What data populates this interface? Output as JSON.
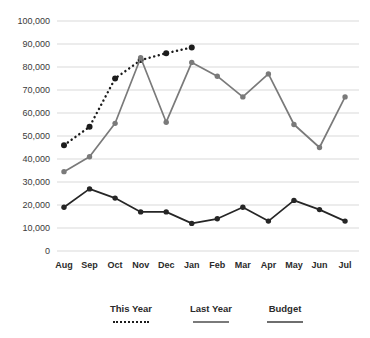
{
  "chart_data": {
    "type": "line",
    "title": "",
    "xlabel": "",
    "ylabel": "",
    "categories": [
      "Aug",
      "Sep",
      "Oct",
      "Nov",
      "Dec",
      "Jan",
      "Feb",
      "Mar",
      "Apr",
      "May",
      "Jun",
      "Jul"
    ],
    "ylim": [
      0,
      100000
    ],
    "ytick_labels": [
      "100,000",
      "90,000",
      "80,000",
      "70,000",
      "60,000",
      "50,000",
      "40,000",
      "30,000",
      "20,000",
      "10,000",
      "0"
    ],
    "ytick_values": [
      100000,
      90000,
      80000,
      70000,
      60000,
      50000,
      40000,
      30000,
      20000,
      10000,
      0
    ],
    "grid": true,
    "legend_position": "bottom",
    "series": [
      {
        "name": "This Year",
        "style": "dashed",
        "color": "#1c1c1c",
        "values": [
          46000,
          54000,
          75000,
          83000,
          86000,
          88500,
          null,
          null,
          null,
          null,
          null,
          null
        ]
      },
      {
        "name": "Last Year",
        "style": "solid",
        "color": "#7a7a7a",
        "values": [
          34500,
          41000,
          55500,
          84000,
          56000,
          82000,
          76000,
          67000,
          77000,
          55000,
          45000,
          67000
        ]
      },
      {
        "name": "Budget",
        "style": "solid",
        "color": "#262626",
        "values": [
          19000,
          27000,
          23000,
          17000,
          17000,
          12000,
          14000,
          19000,
          13000,
          22000,
          18000,
          13000
        ]
      }
    ]
  },
  "legend": {
    "items": [
      {
        "label": "This Year",
        "swatch": "dashed-line-swatch"
      },
      {
        "label": "Last Year",
        "swatch": "solid-line-swatch"
      },
      {
        "label": "Budget",
        "swatch": "solid-line-swatch"
      }
    ]
  },
  "colors": {
    "grid": "#d9d9d9",
    "this_year": "#1c1c1c",
    "last_year": "#7a7a7a",
    "budget": "#262626",
    "text": "#2b2b2b"
  }
}
